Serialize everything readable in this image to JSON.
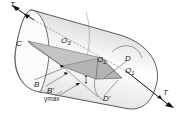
{
  "diagram": {
    "type": "cylinder-torsion",
    "labels": {
      "torque_top": "T",
      "torque_bottom": "T",
      "C": "C",
      "O3": "O",
      "O3_sub": "3",
      "O2": "O",
      "O2_sub": "2",
      "O1": "O",
      "O1_sub": "1",
      "D": "D",
      "D_prime": "D'",
      "B": "B",
      "B_prime": "B'",
      "gamma_max": "γmax"
    },
    "colors": {
      "outline": "#333333",
      "shaded_plane": "#c8c8c8",
      "body_light": "#f4f4f4",
      "body_shadow": "#9a9a9a",
      "arrow": "#111111"
    }
  }
}
